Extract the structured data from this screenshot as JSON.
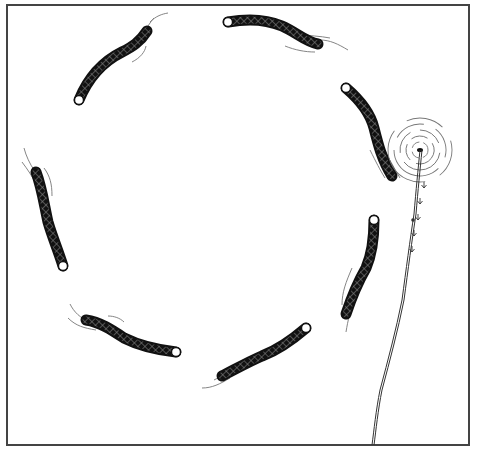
{
  "illustration": {
    "subject": "Eight dark scaled fish swimming in a circle; a line rises from a swirling vortex on the right",
    "colors": {
      "background": "#ffffff",
      "frame": "#444444",
      "fish_body": "#111111",
      "fish_head": "#ffffff",
      "scale_pattern": "#8a8a8a",
      "water_lines": "#777777",
      "line": "#333333"
    },
    "frame": {
      "x": 7,
      "y": 5,
      "width": 462,
      "height": 440
    },
    "fish": [
      {
        "id": "fish-top-left",
        "body": "M79,100 C88,78 102,62 122,52 C132,47 140,42 147,31",
        "head": [
          79,
          100
        ],
        "ripples": [
          "M138,40 C146,30 150,22 154,18",
          "M150,22 C156,16 162,14 168,13",
          "M132,62 C140,58 145,52 146,46"
        ]
      },
      {
        "id": "fish-top",
        "body": "M228,22 C250,18 268,20 282,26 C296,32 306,42 318,44",
        "head": [
          228,
          22
        ],
        "ripples": [
          "M298,34 C310,36 320,36 330,38",
          "M320,40 C330,40 338,44 348,50",
          "M285,46 C295,50 305,52 315,52"
        ]
      },
      {
        "id": "fish-right-upper",
        "body": "M346,88 C360,100 370,112 374,128 C378,144 382,160 392,176",
        "head": [
          346,
          88
        ],
        "ripples": [
          "M370,150 C376,162 380,170 385,178",
          "M384,150 C390,160 394,168 400,178"
        ]
      },
      {
        "id": "fish-right-lower",
        "body": "M374,220 C374,238 372,254 366,268 C358,282 352,296 346,314",
        "head": [
          374,
          220
        ],
        "ripples": [
          "M352,268 C346,282 342,292 342,305",
          "M356,300 C350,310 348,320 346,332"
        ]
      },
      {
        "id": "fish-bottom-right",
        "body": "M306,328 C292,340 278,350 262,356 C248,362 234,370 222,376",
        "head": [
          306,
          328
        ],
        "ripples": [
          "M230,378 C220,384 212,388 202,388",
          "M238,368 C228,372 222,376 214,380"
        ]
      },
      {
        "id": "fish-bottom-left",
        "body": "M176,352 C158,350 140,346 124,338 C112,330 100,322 86,320",
        "head": [
          176,
          352
        ],
        "ripples": [
          "M70,304 C74,312 80,318 90,322",
          "M68,318 C76,326 84,328 96,330",
          "M108,316 C114,316 120,318 124,322"
        ]
      },
      {
        "id": "fish-left",
        "body": "M63,266 C58,250 52,236 48,222 C44,204 42,188 36,172",
        "head": [
          63,
          266
        ],
        "ripples": [
          "M24,148 C26,156 30,164 34,170",
          "M22,162 C28,170 32,176 36,184",
          "M44,168 C50,176 52,184 52,196"
        ]
      }
    ],
    "vortex": {
      "center": [
        420,
        150
      ],
      "rings": [
        8,
        14,
        20,
        26,
        32
      ]
    },
    "line": {
      "path": "M420,150 C418,170 416,190 414,214 C410,240 406,270 402,300 C396,330 388,360 380,390 C376,410 374,430 372,445"
    },
    "arrows": [
      [
        424,
        188
      ],
      [
        420,
        204
      ],
      [
        418,
        220
      ],
      [
        414,
        236
      ],
      [
        412,
        252
      ]
    ]
  }
}
